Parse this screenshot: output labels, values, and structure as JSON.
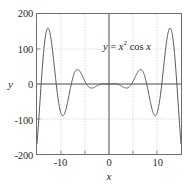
{
  "chart_data": {
    "type": "line",
    "title": "",
    "xlabel": "x",
    "ylabel": "y",
    "annotation": "y = x² cos x",
    "annotation_parts": {
      "lhs": "y",
      "equals": "=",
      "base": "x",
      "exponent": "2",
      "fn": "cos",
      "arg": "x"
    },
    "xlim": [
      -15,
      15
    ],
    "ylim": [
      -200,
      200
    ],
    "grid": true,
    "grid_style": "dotted",
    "legend": "none",
    "xticks": [
      -15,
      -10,
      -5,
      0,
      5,
      10,
      15
    ],
    "xtick_labels": [
      "",
      "-10",
      "",
      "0",
      "",
      "10",
      ""
    ],
    "yticks": [
      -200,
      -100,
      0,
      100,
      200
    ],
    "ytick_labels": [
      "-200",
      "-100",
      "0",
      "100",
      "200"
    ],
    "expression": "y = x^2 * cos(x)",
    "series": [
      {
        "name": "y = x² cos x",
        "color": "#555555",
        "x": [
          -15.0,
          -14.7,
          -14.4,
          -14.1,
          -13.8,
          -13.5,
          -13.2,
          -12.9,
          -12.6,
          -12.3,
          -12.0,
          -11.7,
          -11.4,
          -11.1,
          -10.8,
          -10.5,
          -10.2,
          -9.9,
          -9.6,
          -9.3,
          -9.0,
          -8.7,
          -8.4,
          -8.1,
          -7.8,
          -7.5,
          -7.2,
          -6.9,
          -6.6,
          -6.3,
          -6.0,
          -5.7,
          -5.4,
          -5.1,
          -4.8,
          -4.5,
          -4.2,
          -3.9,
          -3.6,
          -3.3,
          -3.0,
          -2.7,
          -2.4,
          -2.1,
          -1.8,
          -1.5,
          -1.2,
          -0.9,
          -0.6,
          -0.3,
          0.0,
          0.3,
          0.6,
          0.9,
          1.2,
          1.5,
          1.8,
          2.1,
          2.4,
          2.7,
          3.0,
          3.3,
          3.6,
          3.9,
          4.2,
          4.5,
          4.8,
          5.1,
          5.4,
          5.7,
          6.0,
          6.3,
          6.6,
          6.9,
          7.2,
          7.5,
          7.8,
          8.1,
          8.4,
          8.7,
          9.0,
          9.3,
          9.6,
          9.9,
          10.2,
          10.5,
          10.8,
          11.1,
          11.4,
          11.7,
          12.0,
          12.3,
          12.6,
          12.9,
          13.2,
          13.5,
          13.8,
          14.1,
          14.4,
          14.7,
          15.0
        ],
        "key_points": {
          "local_maxima": [
            {
              "x": -12.57,
              "y": 158.0
            },
            {
              "x": -6.28,
              "y": 39.5
            },
            {
              "x": 0.0,
              "y": 0.0
            },
            {
              "x": 6.28,
              "y": 39.5
            },
            {
              "x": 12.57,
              "y": 158.0
            }
          ],
          "local_minima": [
            {
              "x": -9.42,
              "y": -88.8
            },
            {
              "x": -3.14,
              "y": -9.9
            },
            {
              "x": 3.14,
              "y": -9.9
            },
            {
              "x": 9.42,
              "y": -88.8
            }
          ],
          "endpoints": [
            {
              "x": -15.0,
              "y": -171.1
            },
            {
              "x": 15.0,
              "y": -171.1
            }
          ]
        }
      }
    ]
  },
  "colors": {
    "curve": "#555555",
    "frame": "#6e6e6e",
    "grid": "#b9b9b9",
    "zero_axis": "#4a4a4a",
    "text": "#1f1f1f",
    "background": "#ffffff"
  }
}
